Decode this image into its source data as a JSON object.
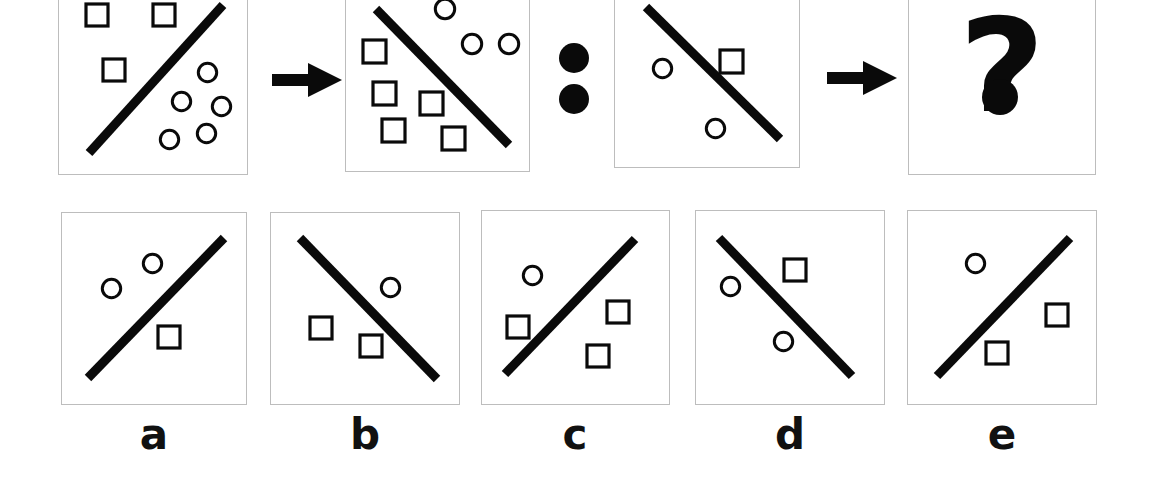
{
  "figure": {
    "type": "visual-analogy-puzzle",
    "stroke_color": "#0a0a0a",
    "panel_border_color": "#bdbdbd",
    "background_color": "#ffffff",
    "width": 1153,
    "height": 503
  },
  "top_row": {
    "panels": [
      {
        "id": "panel-a-source",
        "name": "source-panel-1",
        "rect": [
          58,
          -14,
          190,
          189
        ],
        "line": {
          "x1": 30,
          "y1": 166,
          "x2": 164,
          "y2": 18,
          "slope": "up-right"
        },
        "squares": [
          [
            27,
            17
          ],
          [
            94,
            17
          ],
          [
            44,
            72
          ]
        ],
        "circles": [
          [
            138,
            75
          ],
          [
            112,
            104
          ],
          [
            152,
            109
          ],
          [
            137,
            136
          ],
          [
            100,
            142
          ]
        ],
        "square_size": 22,
        "circle_size": 21
      },
      {
        "id": "panel-b-source",
        "name": "source-panel-2",
        "rect": [
          345,
          -14,
          185,
          186
        ],
        "line": {
          "x1": 30,
          "y1": 22,
          "x2": 163,
          "y2": 158,
          "slope": "down-right"
        },
        "squares": [
          [
            17,
            53
          ],
          [
            27,
            95
          ],
          [
            74,
            105
          ],
          [
            36,
            132
          ],
          [
            96,
            140
          ]
        ],
        "circles": [
          [
            88,
            11
          ],
          [
            115,
            46
          ],
          [
            152,
            46
          ]
        ],
        "square_size": 23,
        "circle_size": 22
      },
      {
        "id": "panel-c-source",
        "name": "source-panel-3",
        "rect": [
          614,
          -14,
          186,
          182
        ],
        "line": {
          "x1": 31,
          "y1": 20,
          "x2": 165,
          "y2": 152,
          "slope": "down-right"
        },
        "squares": [
          [
            105,
            63
          ]
        ],
        "circles": [
          [
            37,
            71
          ],
          [
            90,
            131
          ]
        ],
        "square_size": 23,
        "circle_size": 21
      },
      {
        "id": "panel-answer-unknown",
        "name": "answer-placeholder-panel",
        "rect": [
          908,
          -14,
          188,
          189
        ],
        "question_mark": "?"
      }
    ],
    "arrows": [
      {
        "name": "arrow-1",
        "rect": [
          272,
          62,
          70,
          36
        ],
        "glyph": "arrow-right-icon"
      },
      {
        "name": "arrow-2",
        "rect": [
          827,
          60,
          70,
          36
        ],
        "glyph": "arrow-right-icon"
      }
    ],
    "separator": {
      "name": "analogy-colon",
      "glyph": "colon-icon",
      "dots": [
        {
          "cx": 574,
          "cy": 58,
          "r": 15
        },
        {
          "cx": 574,
          "cy": 99,
          "r": 15
        }
      ]
    }
  },
  "options_row": {
    "options": [
      {
        "id": "option-a",
        "label": "a",
        "rect": [
          61,
          212,
          186,
          193
        ],
        "line": {
          "x1": 26,
          "y1": 165,
          "x2": 162,
          "y2": 25,
          "slope": "up-right"
        },
        "circles": [
          [
            39,
            65
          ],
          [
            80,
            40
          ]
        ],
        "squares": [
          [
            96,
            113
          ]
        ],
        "square_size": 22,
        "circle_size": 21,
        "label_x": 154
      },
      {
        "id": "option-b",
        "label": "b",
        "rect": [
          270,
          212,
          190,
          193
        ],
        "line": {
          "x1": 29,
          "y1": 25,
          "x2": 166,
          "y2": 166,
          "slope": "down-right"
        },
        "circles": [
          [
            109,
            64
          ]
        ],
        "squares": [
          [
            39,
            104
          ],
          [
            89,
            122
          ]
        ],
        "square_size": 22,
        "circle_size": 21,
        "label_x": 365
      },
      {
        "id": "option-c",
        "label": "c",
        "rect": [
          481,
          210,
          189,
          195
        ],
        "line": {
          "x1": 23,
          "y1": 163,
          "x2": 153,
          "y2": 28,
          "slope": "up-right"
        },
        "circles": [
          [
            40,
            54
          ]
        ],
        "squares": [
          [
            25,
            105
          ],
          [
            125,
            90
          ],
          [
            105,
            134
          ]
        ],
        "square_size": 22,
        "circle_size": 21,
        "label_x": 575
      },
      {
        "id": "option-d",
        "label": "d",
        "rect": [
          695,
          210,
          190,
          195
        ],
        "line": {
          "x1": 23,
          "y1": 27,
          "x2": 156,
          "y2": 165,
          "slope": "down-right"
        },
        "circles": [
          [
            24,
            65
          ],
          [
            77,
            120
          ]
        ],
        "squares": [
          [
            88,
            48
          ]
        ],
        "square_size": 22,
        "circle_size": 21,
        "label_x": 790
      },
      {
        "id": "option-e",
        "label": "e",
        "rect": [
          907,
          210,
          190,
          195
        ],
        "line": {
          "x1": 29,
          "y1": 165,
          "x2": 162,
          "y2": 27,
          "slope": "up-right"
        },
        "circles": [
          [
            57,
            42
          ]
        ],
        "squares": [
          [
            138,
            93
          ],
          [
            78,
            131
          ]
        ],
        "square_size": 22,
        "circle_size": 21,
        "label_x": 1002
      }
    ],
    "label_y": 414
  }
}
